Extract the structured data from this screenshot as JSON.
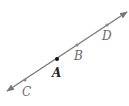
{
  "diagram": {
    "type": "line",
    "line": {
      "start": [
        7,
        91
      ],
      "end": [
        127,
        12
      ],
      "color": "#777777",
      "arrows": "both"
    },
    "points": [
      {
        "label": "C",
        "x": 25,
        "y": 80,
        "label_x": 22,
        "label_y": 96,
        "color": "#888888"
      },
      {
        "label": "A",
        "x": 57,
        "y": 59,
        "label_x": 52,
        "label_y": 77,
        "color": "#111111"
      },
      {
        "label": "B",
        "x": 77,
        "y": 45,
        "label_x": 74,
        "label_y": 60,
        "color": "#888888"
      },
      {
        "label": "D",
        "x": 107,
        "y": 25,
        "label_x": 102,
        "label_y": 40,
        "color": "#888888"
      }
    ]
  }
}
